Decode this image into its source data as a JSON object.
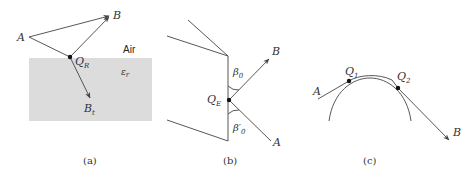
{
  "panels": {
    "a": {
      "caption": "(a)",
      "point_a": "A",
      "point_b": "B",
      "reflection_point": {
        "main": "Q",
        "sub": "R"
      },
      "transmitted_point": {
        "main": "B",
        "sub": "t"
      },
      "medium_above": "Air",
      "medium_below": {
        "main": "ε",
        "sub": "r"
      },
      "medium_color": "#dcdcdc"
    },
    "b": {
      "caption": "(b)",
      "point_a": "A",
      "point_b": "B",
      "edge_point": {
        "main": "Q",
        "sub": "E"
      },
      "angle_top": {
        "main": "β",
        "sub": "0"
      },
      "angle_bottom": {
        "main": "β′",
        "sub": "0"
      }
    },
    "c": {
      "caption": "(c)",
      "point_a": "A",
      "point_b": "B",
      "point_q1": {
        "main": "Q",
        "sub": "1"
      },
      "point_q2": {
        "main": "Q",
        "sub": "2"
      }
    }
  }
}
